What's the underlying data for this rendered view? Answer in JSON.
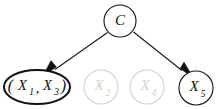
{
  "diagram": {
    "type": "directed-graph",
    "background_color": "#ffffff",
    "edge_color": "#1a1a1a",
    "active_node_color": "#1a1a1a",
    "merged_node_color": "#111111",
    "faded_node_color": "#cfcfcf",
    "nodes": [
      {
        "id": "C",
        "label": "C",
        "role": "class-node",
        "shape": "circle",
        "state": "active",
        "cx": 120,
        "cy": 21,
        "r": 16
      },
      {
        "id": "X1X3",
        "label": "(X1,X3)",
        "label_open_paren": "(",
        "label_close_paren": ")",
        "label_comma": ",",
        "label_var1": "X",
        "label_sub1": "1",
        "label_var2": "X",
        "label_sub2": "3",
        "role": "merged-feature-node",
        "shape": "ellipse",
        "state": "merged",
        "cx": 37,
        "cy": 87,
        "rx": 33,
        "ry": 17
      },
      {
        "id": "X2",
        "label": "X2",
        "label_var": "X",
        "label_sub": "2",
        "role": "feature-node",
        "shape": "circle",
        "state": "inactive",
        "cx": 101,
        "cy": 87,
        "r": 17
      },
      {
        "id": "X4",
        "label": "X4",
        "label_var": "X",
        "label_sub": "4",
        "role": "feature-node",
        "shape": "circle",
        "state": "inactive",
        "cx": 147,
        "cy": 87,
        "r": 17
      },
      {
        "id": "X5",
        "label": "X5",
        "label_var": "X",
        "label_sub": "5",
        "role": "feature-node",
        "shape": "circle",
        "state": "active",
        "cx": 196,
        "cy": 88,
        "r": 17
      }
    ],
    "edges": [
      {
        "id": "edge-c-x1x3",
        "from": "C",
        "to": "X1X3",
        "directed": true,
        "arrowhead": "filled-triangle",
        "x1": 107,
        "y1": 32,
        "x2": 51,
        "y2": 72
      },
      {
        "id": "edge-c-x5",
        "from": "C",
        "to": "X5",
        "directed": true,
        "arrowhead": "filled-triangle",
        "x1": 134,
        "y1": 32,
        "x2": 185,
        "y2": 73
      }
    ]
  }
}
